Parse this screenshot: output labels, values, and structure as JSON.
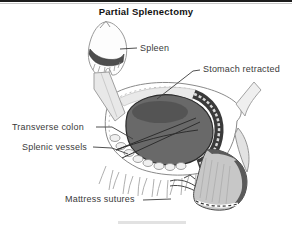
{
  "title": "Partial Splenectomy",
  "labels": {
    "spleen": "Spleen",
    "stomach": "Stomach retracted",
    "colon": "Transverse colon",
    "vessels": "Splenic vessels",
    "sutures": "Mattress sutures"
  },
  "colors": {
    "organ_gray": "#696969",
    "capsule_dark": "#555555",
    "leader_line": "#3d3d3d",
    "tissue_light": "#e8e8e8"
  }
}
